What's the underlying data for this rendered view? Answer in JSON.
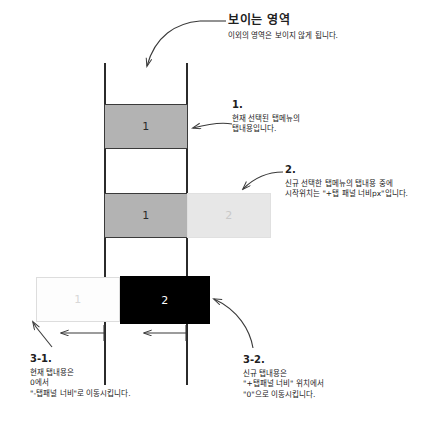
{
  "canvas": {
    "width": 433,
    "height": 432,
    "background": "#ffffff"
  },
  "diagram": {
    "title_note": {
      "heading": "보이는 영역",
      "description": "이외의 영역은 보이지 않게 됩니다."
    },
    "notes": [
      {
        "id": "1",
        "number": "1.",
        "lines": [
          "현재 선택된 탭메뉴의",
          "탭내용입니다."
        ]
      },
      {
        "id": "2",
        "number": "2.",
        "lines": [
          "신규 선택한 탭메뉴의 탭내용 중에",
          "시작위치는 \"+탭 패널 너비px\"입니다."
        ]
      },
      {
        "id": "3-1",
        "number": "3-1.",
        "lines": [
          "현재 탭내용은",
          "0에서",
          "\"-탭패널 너비\"로 이동시킵니다."
        ]
      },
      {
        "id": "3-2",
        "number": "3-2.",
        "lines": [
          "신규 탭내용은",
          "\"+탭패널 너비\" 위치에서",
          "\"0\"으로 이동시킵니다."
        ]
      }
    ],
    "boxes": [
      {
        "id": "current-top",
        "label": "1",
        "state": "visible-current",
        "fill": "#b3b3b3",
        "stroke": "#3a3a3a",
        "text_color": "#2a2a2a"
      },
      {
        "id": "current-mid",
        "label": "1",
        "state": "visible-current",
        "fill": "#b3b3b3",
        "stroke": "#3a3a3a",
        "text_color": "#2a2a2a"
      },
      {
        "id": "new-offscreen",
        "label": "2",
        "state": "ghost-incoming",
        "fill": "#e7e7e7",
        "stroke": "#e0e0e0",
        "text_color": "#c9c9c9"
      },
      {
        "id": "current-moved",
        "label": "1",
        "state": "ghost-outgoing",
        "fill": "#fdfdfd",
        "stroke": "#dddddd",
        "text_color": "#d8d8d8"
      },
      {
        "id": "new-arrived",
        "label": "2",
        "state": "visible-new",
        "fill": "#000000",
        "stroke": "#000000",
        "text_color": "#ffffff"
      }
    ],
    "rails": {
      "color": "#2b2b2b",
      "left_label": "viewport-left-edge",
      "right_label": "viewport-right-edge"
    },
    "arrow_color": "#3a3a3a"
  }
}
